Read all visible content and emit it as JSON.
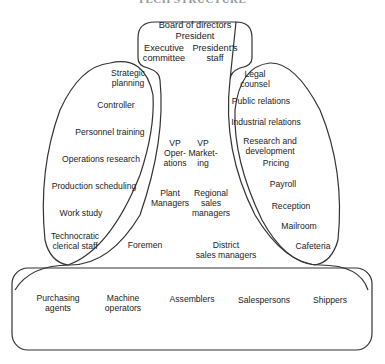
{
  "title": "TECH STRUCTURE",
  "strategic_apex": {
    "lines": [
      "Board of directors",
      "President"
    ],
    "left": [
      "Executive",
      "committee"
    ],
    "right": [
      "President's",
      "staff"
    ]
  },
  "technostructure": [
    [
      "Strategic",
      "planning"
    ],
    [
      "Controller"
    ],
    [
      "Personnel training"
    ],
    [
      "Operations research"
    ],
    [
      "Production scheduling"
    ],
    [
      "Work study"
    ],
    [
      "Technocratic",
      "clerical staff"
    ]
  ],
  "support_staff": [
    [
      "Legal",
      "counsel"
    ],
    [
      "Public relations"
    ],
    [
      "Industrial relations"
    ],
    [
      "Research and",
      "development"
    ],
    [
      "Pricing"
    ],
    [
      "Payroll"
    ],
    [
      "Reception"
    ],
    [
      "Mailroom"
    ],
    [
      "Cafeteria"
    ]
  ],
  "middle_line": {
    "vp_operations": [
      "VP",
      "Oper-",
      "ations"
    ],
    "vp_marketing": [
      "VP",
      "Market-",
      "ing"
    ],
    "plant_managers": [
      "Plant",
      "Managers"
    ],
    "regional_sales_managers": [
      "Regional",
      "sales",
      "managers"
    ],
    "foremen": [
      "Foremen"
    ],
    "district_sales_managers": [
      "District",
      "sales managers"
    ]
  },
  "operating_core": [
    [
      "Purchasing",
      "agents"
    ],
    [
      "Machine",
      "operators"
    ],
    [
      "Assemblers"
    ],
    [
      "Salespersons"
    ],
    [
      "Shippers"
    ]
  ],
  "colors": {
    "stroke": "#333333",
    "text": "#222222",
    "background": "#ffffff"
  }
}
